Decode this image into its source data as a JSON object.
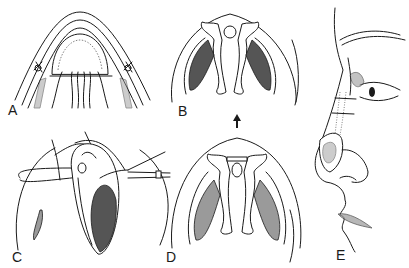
{
  "figure": {
    "panels": [
      {
        "id": "A",
        "label": "A",
        "content": "Cross-section view of nasal tip with sutures"
      },
      {
        "id": "B",
        "label": "B",
        "content": "Basal view of nose showing nostrils and columella with cartilage"
      },
      {
        "id": "C",
        "label": "C",
        "content": "Open surgical field with retracted tissue and instrument"
      },
      {
        "id": "D",
        "label": "D",
        "content": "Basal view of nose after suture placement"
      },
      {
        "id": "E",
        "label": "E",
        "content": "Lateral profile of face with nasal dorsum graft"
      }
    ],
    "arrow": {
      "direction": "up",
      "from": "D",
      "to": "B"
    },
    "colors": {
      "line": "#1a1a1a",
      "background": "#ffffff",
      "shading": "#555555"
    }
  }
}
